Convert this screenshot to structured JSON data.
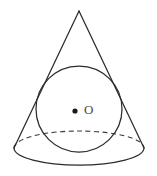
{
  "figure": {
    "background_color": "#ffffff",
    "stroke_color": "#2b2b2b",
    "dashed_stroke_color": "#3a3a3a",
    "label_color": "#4a4a4a",
    "labels": {
      "center_point": "O"
    },
    "geometry": {
      "apex": {
        "x": 79,
        "y": 11
      },
      "base_ellipse": {
        "cx": 79,
        "cy": 148,
        "rx": 65,
        "ry": 17
      },
      "base_left_vertex": {
        "x": 14,
        "y": 148
      },
      "base_right_vertex": {
        "x": 144,
        "y": 148
      },
      "inscribed_circle": {
        "cx": 79,
        "cy": 109,
        "r": 43
      },
      "center_dot": {
        "cx": 75,
        "cy": 111,
        "r": 2.6
      },
      "label_position": {
        "x": 84,
        "y": 111
      }
    },
    "elements": [
      {
        "name": "cone-left-slant",
        "style": "solid"
      },
      {
        "name": "cone-right-slant",
        "style": "solid"
      },
      {
        "name": "base-ellipse-front",
        "style": "solid"
      },
      {
        "name": "base-ellipse-back",
        "style": "dashed"
      },
      {
        "name": "inscribed-sphere-outline",
        "style": "solid"
      },
      {
        "name": "sphere-center-dot",
        "style": "filled"
      },
      {
        "name": "sphere-center-label",
        "style": "text"
      }
    ]
  }
}
